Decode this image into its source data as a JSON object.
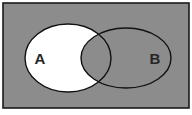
{
  "figure": {
    "type": "venn-diagram",
    "title": "",
    "canvas": {
      "width": 192,
      "height": 115
    },
    "universe": {
      "name": "universal-set-rectangle",
      "label": "",
      "fill": "#8c8c8c",
      "stroke": "#1a1a1a",
      "stroke_width": 1.6,
      "x": 3,
      "y": 3,
      "width": 186,
      "height": 105
    },
    "sets": [
      {
        "id": "A",
        "label": "A",
        "shape": "ellipse",
        "cx": 68,
        "cy": 58,
        "rx": 43,
        "ry": 34,
        "fill": "#ffffff",
        "stroke": "#111111",
        "stroke_width": 1.4,
        "label_x": 40,
        "label_y": 58
      },
      {
        "id": "B",
        "label": "B",
        "shape": "ellipse",
        "cx": 126,
        "cy": 58,
        "rx": 45,
        "ry": 30,
        "fill": "none",
        "stroke": "#111111",
        "stroke_width": 1.4,
        "label_x": 155,
        "label_y": 58
      }
    ],
    "shaded_region": {
      "name": "a-minus-b",
      "description": "A only (A without B) is shaded white; the intersection and B-only remain the background gray",
      "fill": "#ffffff"
    },
    "background": "#ffffff"
  }
}
